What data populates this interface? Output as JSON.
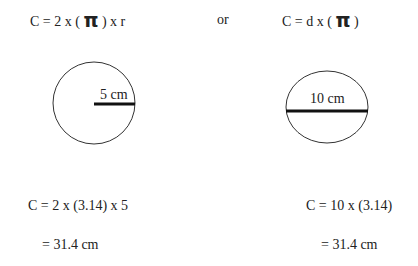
{
  "formulas": {
    "left": {
      "prefix": "C = 2 x ( ",
      "pi": "π",
      "suffix": " ) x r"
    },
    "or": "or",
    "right": {
      "prefix": "C = d x ( ",
      "pi": "π",
      "suffix": " )"
    }
  },
  "diagrams": {
    "left": {
      "shape": "circle",
      "measure": "radius",
      "label": "5 cm"
    },
    "right": {
      "shape": "circle",
      "measure": "diameter",
      "label": "10 cm"
    }
  },
  "calculations": {
    "left": {
      "line1": "C = 2 x (3.14) x 5",
      "line2": "= 31.4 cm"
    },
    "right": {
      "line1": "C = 10 x (3.14)",
      "line2": "= 31.4 cm"
    }
  },
  "colors": {
    "stroke": "#222222",
    "text": "#222222",
    "background": "#ffffff"
  }
}
